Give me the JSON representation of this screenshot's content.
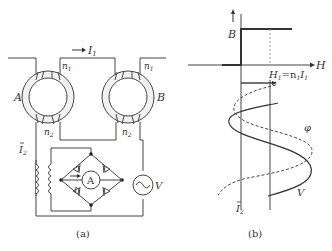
{
  "figure_a": {
    "caption": "(a)",
    "current_I1": "I",
    "current_I1_sub": "1",
    "core_left": "A",
    "core_right": "B",
    "n1_left": "n",
    "n1_left_sub": "1",
    "n1_right": "n",
    "n1_right_sub": "1",
    "n2_left": "n",
    "n2_left_sub": "2",
    "n2_right": "n",
    "n2_right_sub": "2",
    "current_I2": "I",
    "current_I2_sub": "2",
    "ammeter": "A",
    "ammeter_current": "I",
    "source_label": "V"
  },
  "figure_b": {
    "caption": "(b)",
    "axis_B": "B",
    "axis_H": "H",
    "h1_label": "H",
    "h1_sub": "1",
    "h1_eq": "=n",
    "h1_n_sub": "1",
    "h1_I": "I",
    "h1_I_sub": "1",
    "phi_label": "φ",
    "V_label": "V",
    "I2_label": "I",
    "I2_sub": "2"
  }
}
